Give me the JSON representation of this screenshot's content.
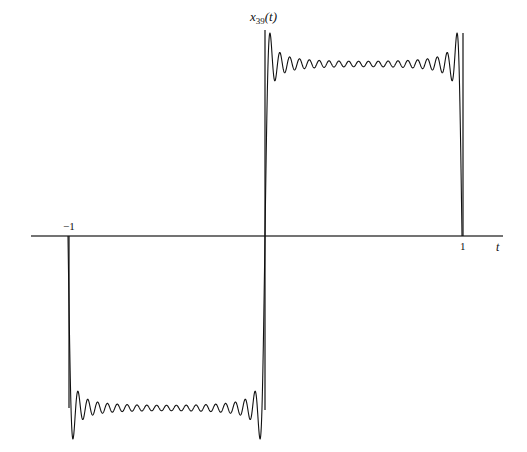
{
  "chart_data": {
    "type": "line",
    "title": "",
    "xlabel": "t",
    "ylabel": "x_39(t)",
    "ylabel_main": "x",
    "ylabel_sub": "39",
    "ylabel_arg": "(t)",
    "x_ticks": [
      "-1",
      "1"
    ],
    "xlim": [
      -1.2,
      1.2
    ],
    "ylim": [
      -1.3,
      1.3
    ],
    "grid": false,
    "legend": null,
    "series": [
      {
        "name": "x_39(t)",
        "description": "Fourier series partial sum (N=39) of a square wave: -1 on (-1,0), +1 on (0,1), with Gibbs ringing near discontinuities at t=-1, 0, 1",
        "N": 39,
        "x": [
          -1,
          -0.5,
          0,
          0.5,
          1
        ],
        "values": [
          0,
          -1,
          0,
          1,
          0
        ],
        "overshoot": 1.09
      }
    ],
    "colors": {
      "line": "#111111",
      "axis": "#333333",
      "background": "#ffffff"
    }
  },
  "labels": {
    "tick_minus_one": "−1",
    "tick_plus_one": "1",
    "x_axis": "t",
    "y_main": "x",
    "y_sub": "39",
    "y_arg": "(t)"
  }
}
